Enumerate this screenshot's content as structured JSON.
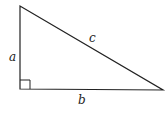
{
  "diagram": {
    "type": "right-triangle",
    "labels": {
      "a": "a",
      "b": "b",
      "c": "c"
    },
    "stroke_color": "#222222",
    "background": "#ffffff"
  }
}
